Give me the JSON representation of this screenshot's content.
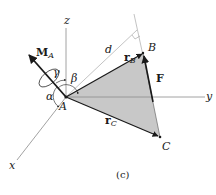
{
  "figure": {
    "caption": "(c)",
    "axes": {
      "x": "x",
      "y": "y",
      "z": "z"
    },
    "points": {
      "A": "A",
      "B": "B",
      "C": "C"
    },
    "vectors": {
      "moment": {
        "symbol": "M",
        "subscript": "A"
      },
      "force": "F",
      "r_B": {
        "symbol": "r",
        "subscript": "B"
      },
      "r_C": {
        "symbol": "r",
        "subscript": "C"
      }
    },
    "distance": "d",
    "angles": {
      "alpha": "α",
      "beta": "β",
      "gamma": "γ"
    },
    "colors": {
      "line": "#1a1a1a",
      "axis": "#8a8a8a",
      "triangle_fill": "#c8c8c8",
      "guide": "#9a9a9a"
    }
  }
}
